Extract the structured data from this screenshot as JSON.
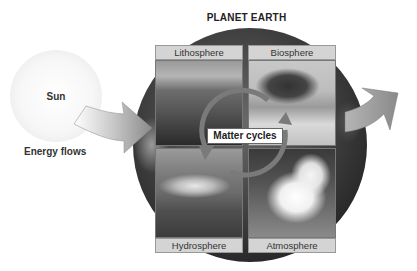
{
  "diagram": {
    "title": "PLANET EARTH",
    "sun": {
      "label": "Sun"
    },
    "energy": {
      "label": "Energy flows"
    },
    "center": {
      "label": "Matter cycles"
    },
    "spheres": [
      {
        "label": "Lithosphere",
        "position": "top-left",
        "photo": "rock-formation"
      },
      {
        "label": "Biosphere",
        "position": "top-right",
        "photo": "acacia-tree-savanna"
      },
      {
        "label": "Hydrosphere",
        "position": "bottom-left",
        "photo": "ocean-wave"
      },
      {
        "label": "Atmosphere",
        "position": "bottom-right",
        "photo": "cumulus-clouds"
      }
    ],
    "arrows": [
      {
        "name": "energy-in",
        "from": "Sun",
        "to": "Planet Earth"
      },
      {
        "name": "energy-out",
        "from": "Planet Earth",
        "to": "space"
      },
      {
        "name": "matter-cycle",
        "type": "circular"
      }
    ],
    "colors": {
      "label_fill": "#d4d4d4",
      "arrow_gray": "#8a8a8a",
      "earth_dark": "#2a2a2a"
    }
  }
}
